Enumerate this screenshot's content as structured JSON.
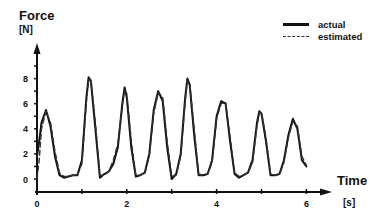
{
  "chart_data": {
    "type": "line",
    "title": "",
    "xlabel": "Time",
    "xunit": "[s]",
    "ylabel": "Force",
    "yunit": "[N]",
    "xlim": [
      0,
      6.5
    ],
    "ylim": [
      -0.5,
      9.5
    ],
    "xticks": [
      0,
      1,
      2,
      3,
      4,
      5,
      6
    ],
    "xtick_labels": [
      "0",
      "",
      "2",
      "",
      "4",
      "",
      "6"
    ],
    "yticks": [
      -0.5,
      0,
      1,
      2,
      3,
      4,
      5,
      6,
      7,
      8,
      9
    ],
    "ytick_labels": [
      "0",
      "2",
      "4",
      "6",
      "8"
    ],
    "ytick_label_values": [
      0,
      2,
      4,
      6,
      8
    ],
    "grid": false,
    "legend_position": "top-right",
    "series": [
      {
        "name": "actual",
        "style": "solid",
        "x": [
          0.0,
          0.05,
          0.1,
          0.2,
          0.3,
          0.4,
          0.5,
          0.6,
          0.7,
          0.8,
          0.9,
          1.0,
          1.1,
          1.15,
          1.2,
          1.3,
          1.4,
          1.5,
          1.6,
          1.7,
          1.8,
          1.9,
          1.95,
          2.0,
          2.1,
          2.2,
          2.3,
          2.4,
          2.5,
          2.6,
          2.7,
          2.8,
          2.9,
          3.0,
          3.1,
          3.2,
          3.3,
          3.35,
          3.4,
          3.5,
          3.6,
          3.7,
          3.8,
          3.9,
          4.0,
          4.1,
          4.2,
          4.3,
          4.4,
          4.5,
          4.6,
          4.7,
          4.8,
          4.9,
          4.95,
          5.0,
          5.1,
          5.2,
          5.3,
          5.4,
          5.5,
          5.6,
          5.7,
          5.8,
          5.9,
          6.0
        ],
        "y": [
          1.8,
          3.0,
          4.5,
          5.5,
          4.2,
          1.8,
          0.3,
          0.1,
          0.2,
          0.3,
          0.3,
          1.5,
          6.5,
          8.1,
          7.8,
          4.0,
          0.1,
          0.4,
          0.6,
          1.2,
          2.5,
          6.0,
          7.3,
          6.5,
          2.5,
          0.2,
          0.3,
          0.5,
          2.0,
          5.5,
          7.0,
          6.2,
          2.5,
          0.0,
          0.4,
          2.0,
          6.5,
          8.0,
          7.5,
          3.5,
          0.3,
          0.3,
          0.4,
          1.5,
          5.0,
          6.2,
          6.0,
          3.0,
          0.4,
          0.1,
          0.3,
          0.5,
          1.5,
          4.5,
          5.4,
          5.2,
          3.0,
          0.3,
          0.3,
          0.4,
          1.5,
          3.5,
          4.8,
          4.0,
          1.5,
          1.0
        ]
      },
      {
        "name": "estimated",
        "style": "dashed",
        "x": [
          0.0,
          0.05,
          0.1,
          0.2,
          0.3,
          0.4,
          0.5,
          0.6,
          0.7,
          0.8,
          0.9,
          1.0,
          1.1,
          1.15,
          1.2,
          1.3,
          1.4,
          1.5,
          1.6,
          1.7,
          1.8,
          1.9,
          1.95,
          2.0,
          2.1,
          2.2,
          2.3,
          2.4,
          2.5,
          2.6,
          2.7,
          2.8,
          2.9,
          3.0,
          3.1,
          3.2,
          3.3,
          3.35,
          3.4,
          3.5,
          3.6,
          3.7,
          3.8,
          3.9,
          4.0,
          4.1,
          4.2,
          4.3,
          4.4,
          4.5,
          4.6,
          4.7,
          4.8,
          4.9,
          4.95,
          5.0,
          5.1,
          5.2,
          5.3,
          5.4,
          5.5,
          5.6,
          5.7,
          5.8,
          5.9,
          6.0
        ],
        "y": [
          0.0,
          1.5,
          4.0,
          5.4,
          4.5,
          2.2,
          0.5,
          0.2,
          0.2,
          0.3,
          0.3,
          1.2,
          6.2,
          7.9,
          7.9,
          4.5,
          0.3,
          0.3,
          0.6,
          1.5,
          2.8,
          5.8,
          7.1,
          6.8,
          3.0,
          0.3,
          0.3,
          0.5,
          1.8,
          5.2,
          6.9,
          6.5,
          3.0,
          0.2,
          0.3,
          1.8,
          6.2,
          7.8,
          7.6,
          4.0,
          0.4,
          0.3,
          0.4,
          1.3,
          4.8,
          6.0,
          6.1,
          3.4,
          0.5,
          0.2,
          0.3,
          0.5,
          1.3,
          4.2,
          5.3,
          5.3,
          3.3,
          0.4,
          0.3,
          0.4,
          1.3,
          3.3,
          4.6,
          4.2,
          1.8,
          1.1
        ]
      }
    ]
  },
  "labels": {
    "ylabel": "Force",
    "yunit": "[N]",
    "xlabel": "Time",
    "xunit": "[s]"
  },
  "legend": {
    "items": [
      {
        "label": "actual",
        "style": "solid"
      },
      {
        "label": "estimated",
        "style": "dashed"
      }
    ]
  },
  "colors": {
    "actual": "#111111",
    "estimated": "#333333",
    "axis": "#111111"
  }
}
